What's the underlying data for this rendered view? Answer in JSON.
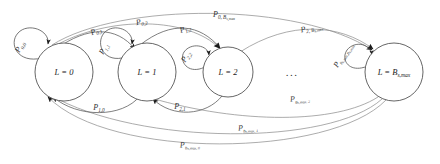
{
  "diagram": {
    "type": "markov-chain-state-transition-diagram",
    "title": "",
    "ellipsis": "...",
    "nodes": [
      {
        "id": "L0",
        "label_var": "L",
        "label_eq": "=",
        "label_val": "0",
        "label_sub": "",
        "cx": 64,
        "cy": 72,
        "r": 29,
        "text": "L = 0"
      },
      {
        "id": "L1",
        "label_var": "L",
        "label_eq": "=",
        "label_val": "1",
        "label_sub": "",
        "cx": 147,
        "cy": 72,
        "r": 29,
        "text": "L = 1"
      },
      {
        "id": "L2",
        "label_var": "L",
        "label_eq": "=",
        "label_val": "2",
        "label_sub": "",
        "cx": 228,
        "cy": 72,
        "r": 25,
        "text": "L = 2"
      },
      {
        "id": "LBmax",
        "label_var": "L",
        "label_eq": "=",
        "label_val": "B",
        "label_sub": "s,max",
        "cx": 394,
        "cy": 72,
        "r": 29,
        "text": "L = B s,max"
      }
    ],
    "self_loops": [
      {
        "id": "loop0",
        "node": "L0",
        "p": "P",
        "sub": "0,0",
        "cx": 28,
        "cy": 50,
        "r": 16
      },
      {
        "id": "loop1",
        "node": "L1",
        "p": "P",
        "sub": "1,1",
        "cx": 111,
        "cy": 50,
        "r": 16
      },
      {
        "id": "loop2",
        "node": "L2",
        "p": "P",
        "sub": "2,2",
        "cx": 193,
        "cy": 62,
        "r": 14
      },
      {
        "id": "loopBmax",
        "node": "LBmax",
        "p": "P",
        "sub": "B s,max , B s,max",
        "cx": 357,
        "cy": 62,
        "r": 14
      }
    ],
    "edges": [
      {
        "id": "e01",
        "from": "L0",
        "to": "L1",
        "p": "P",
        "sub_from": "0",
        "sub_to": "1",
        "label": "P 0,1",
        "label_x": 97,
        "label_y": 32,
        "rotate": -22
      },
      {
        "id": "e02",
        "from": "L0",
        "to": "L2",
        "p": "P",
        "sub_from": "0",
        "sub_to": "2",
        "label": "P 0,2",
        "label_x": 141,
        "label_y": 22,
        "rotate": -14
      },
      {
        "id": "e12",
        "from": "L1",
        "to": "L2",
        "p": "P",
        "sub_from": "1",
        "sub_to": "2",
        "label": "P 1,2",
        "label_x": 186,
        "label_y": 30,
        "rotate": -20
      },
      {
        "id": "e0Bmax",
        "from": "L0",
        "to": "LBmax",
        "p": "P",
        "sub_from": "0",
        "sub_to": "Bs,max",
        "label": "P 0, B s,max",
        "label_x": 208,
        "label_y": 20,
        "rotate": 0
      },
      {
        "id": "e2Bmax",
        "from": "L2",
        "to": "LBmax",
        "p": "P",
        "sub_from": "2",
        "sub_to": "Bs,max",
        "label": "P 2, B s,max",
        "label_x": 296,
        "label_y": 32,
        "rotate": -12
      },
      {
        "id": "e10",
        "from": "L1",
        "to": "L0",
        "p": "P",
        "sub_from": "1",
        "sub_to": "0",
        "label": "P 1,0",
        "label_x": 98,
        "label_y": 110,
        "rotate": 0
      },
      {
        "id": "e21",
        "from": "L2",
        "to": "L1",
        "p": "P",
        "sub_from": "2",
        "sub_to": "1",
        "label": "P 2,1",
        "label_x": 179,
        "label_y": 109,
        "rotate": 0
      },
      {
        "id": "eBmax2",
        "from": "LBmax",
        "to": "L2",
        "p": "P",
        "sub_from": "Bs,max",
        "sub_to": "2",
        "label": "P B s,max , 2",
        "label_x": 288,
        "label_y": 102,
        "rotate": -4
      },
      {
        "id": "eBmax1",
        "from": "LBmax",
        "to": "L1",
        "p": "P",
        "sub_from": "Bs,max",
        "sub_to": "1",
        "label": "P B s,max , 1",
        "label_x": 237,
        "label_y": 131,
        "rotate": -4
      },
      {
        "id": "eBmax0",
        "from": "LBmax",
        "to": "L0",
        "p": "P",
        "sub_from": "Bs,max",
        "sub_to": "0",
        "label": "P B s,max , 0",
        "label_x": 178,
        "label_y": 148,
        "rotate": -3
      }
    ],
    "colors": {
      "stroke": "#555555",
      "stroke_faint": "#888888",
      "text": "#333333",
      "arrow": "#1a1a1a",
      "background": "#ffffff"
    }
  }
}
